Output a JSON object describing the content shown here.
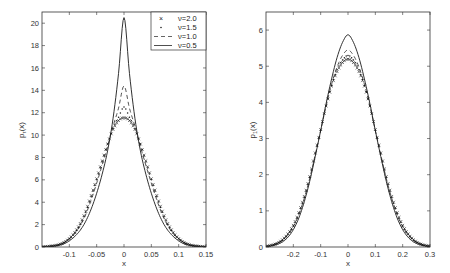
{
  "chart_data": [
    {
      "type": "line",
      "title": "",
      "xlabel": "x",
      "ylabel": "p_τ(x)",
      "xlim": [
        -0.15,
        0.15
      ],
      "ylim": [
        0,
        21
      ],
      "xticks": [
        -0.1,
        -0.05,
        0,
        0.05,
        0.1,
        0.15
      ],
      "xtick_labels": [
        "-0.1",
        "-0.05",
        "0",
        "0.05",
        "0.1",
        "0.15"
      ],
      "yticks": [
        0,
        2,
        4,
        6,
        8,
        10,
        12,
        14,
        16,
        18,
        20
      ],
      "ytick_labels": [
        "0",
        "2",
        "4",
        "6",
        "8",
        "10",
        "12",
        "14",
        "16",
        "18",
        "20"
      ],
      "grid": false,
      "legend_position": "upper right",
      "x": [
        -0.15,
        -0.14,
        -0.13,
        -0.12,
        -0.11,
        -0.1,
        -0.09,
        -0.08,
        -0.07,
        -0.06,
        -0.05,
        -0.04,
        -0.03,
        -0.02,
        -0.01,
        0,
        0.01,
        0.02,
        0.03,
        0.04,
        0.05,
        0.06,
        0.07,
        0.08,
        0.09,
        0.1,
        0.11,
        0.12,
        0.13,
        0.14,
        0.15
      ],
      "series": [
        {
          "name": "ν=2.0",
          "style": "x-marker",
          "values": [
            0.02,
            0.05,
            0.1,
            0.2,
            0.4,
            0.75,
            1.3,
            2.1,
            3.2,
            4.6,
            6.1,
            7.7,
            9.2,
            10.5,
            11.3,
            11.55,
            11.3,
            10.5,
            9.2,
            7.7,
            6.1,
            4.6,
            3.2,
            2.1,
            1.3,
            0.75,
            0.4,
            0.2,
            0.1,
            0.05,
            0.02
          ]
        },
        {
          "name": "ν=1.5",
          "style": "dot-marker",
          "values": [
            0.02,
            0.05,
            0.1,
            0.2,
            0.4,
            0.75,
            1.25,
            2.0,
            3.1,
            4.5,
            6.0,
            7.6,
            9.2,
            10.6,
            11.6,
            12.5,
            11.6,
            10.6,
            9.2,
            7.6,
            6.0,
            4.5,
            3.1,
            2.0,
            1.25,
            0.75,
            0.4,
            0.2,
            0.1,
            0.05,
            0.02
          ]
        },
        {
          "name": "ν=1.0",
          "style": "dashed",
          "values": [
            0.02,
            0.04,
            0.09,
            0.18,
            0.36,
            0.7,
            1.2,
            1.9,
            2.9,
            4.2,
            5.7,
            7.3,
            9.0,
            10.8,
            12.4,
            14.4,
            12.4,
            10.8,
            9.0,
            7.3,
            5.7,
            4.2,
            2.9,
            1.9,
            1.2,
            0.7,
            0.36,
            0.18,
            0.09,
            0.04,
            0.02
          ]
        },
        {
          "name": "ν=0.5",
          "style": "solid",
          "values": [
            0.01,
            0.03,
            0.07,
            0.14,
            0.28,
            0.55,
            0.95,
            1.5,
            2.3,
            3.4,
            4.8,
            6.5,
            8.6,
            11.5,
            15.5,
            20.5,
            15.5,
            11.5,
            8.6,
            6.5,
            4.8,
            3.4,
            2.3,
            1.5,
            0.95,
            0.55,
            0.28,
            0.14,
            0.07,
            0.03,
            0.01
          ]
        }
      ]
    },
    {
      "type": "line",
      "title": "",
      "xlabel": "x",
      "ylabel": "p_1(x)",
      "xlim": [
        -0.3,
        0.3
      ],
      "ylim": [
        0,
        6.5
      ],
      "xticks": [
        -0.2,
        -0.1,
        0,
        0.1,
        0.2,
        0.3
      ],
      "xtick_labels": [
        "-0.2",
        "-0.1",
        "0",
        "0.1",
        "0.2",
        "0.3"
      ],
      "yticks": [
        0,
        1,
        2,
        3,
        4,
        5,
        6
      ],
      "ytick_labels": [
        "0",
        "1",
        "2",
        "3",
        "4",
        "5",
        "6"
      ],
      "grid": false,
      "x": [
        -0.3,
        -0.28,
        -0.26,
        -0.24,
        -0.22,
        -0.2,
        -0.18,
        -0.16,
        -0.14,
        -0.12,
        -0.1,
        -0.08,
        -0.06,
        -0.04,
        -0.02,
        0,
        0.02,
        0.04,
        0.06,
        0.08,
        0.1,
        0.12,
        0.14,
        0.16,
        0.18,
        0.2,
        0.22,
        0.24,
        0.26,
        0.28,
        0.3
      ],
      "series": [
        {
          "name": "ν=2.0",
          "style": "x-marker",
          "values": [
            0.02,
            0.05,
            0.1,
            0.2,
            0.36,
            0.6,
            0.95,
            1.4,
            1.95,
            2.6,
            3.25,
            3.9,
            4.45,
            4.85,
            5.1,
            5.2,
            5.1,
            4.85,
            4.45,
            3.9,
            3.25,
            2.6,
            1.95,
            1.4,
            0.95,
            0.6,
            0.36,
            0.2,
            0.1,
            0.05,
            0.02
          ]
        },
        {
          "name": "ν=1.5",
          "style": "dot-marker",
          "values": [
            0.02,
            0.05,
            0.1,
            0.19,
            0.35,
            0.58,
            0.92,
            1.37,
            1.92,
            2.57,
            3.23,
            3.9,
            4.47,
            4.9,
            5.17,
            5.3,
            5.17,
            4.9,
            4.47,
            3.9,
            3.23,
            2.57,
            1.92,
            1.37,
            0.92,
            0.58,
            0.35,
            0.19,
            0.1,
            0.05,
            0.02
          ]
        },
        {
          "name": "ν=1.0",
          "style": "dashed",
          "values": [
            0.02,
            0.04,
            0.09,
            0.18,
            0.33,
            0.56,
            0.9,
            1.35,
            1.9,
            2.55,
            3.22,
            3.9,
            4.5,
            4.98,
            5.3,
            5.45,
            5.3,
            4.98,
            4.5,
            3.9,
            3.22,
            2.55,
            1.9,
            1.35,
            0.9,
            0.56,
            0.33,
            0.18,
            0.09,
            0.04,
            0.02
          ]
        },
        {
          "name": "ν=0.5",
          "style": "solid",
          "values": [
            0.01,
            0.03,
            0.07,
            0.14,
            0.27,
            0.48,
            0.8,
            1.25,
            1.82,
            2.5,
            3.22,
            3.97,
            4.65,
            5.24,
            5.66,
            5.87,
            5.66,
            5.24,
            4.65,
            3.97,
            3.22,
            2.5,
            1.82,
            1.25,
            0.8,
            0.48,
            0.27,
            0.14,
            0.07,
            0.03,
            0.01
          ]
        }
      ]
    }
  ],
  "legend": {
    "items": [
      {
        "label": "ν=2.0",
        "style": "x-marker"
      },
      {
        "label": "ν=1.5",
        "style": "dot-marker"
      },
      {
        "label": "ν=1.0",
        "style": "dashed"
      },
      {
        "label": "ν=0.5",
        "style": "solid"
      }
    ]
  },
  "left": {
    "xlabel": "x",
    "ylabel_main": "p",
    "ylabel_sub": "τ",
    "ylabel_tail": "(x)"
  },
  "right": {
    "xlabel": "x",
    "ylabel_main": "p",
    "ylabel_sub": "1",
    "ylabel_tail": "(x)"
  }
}
